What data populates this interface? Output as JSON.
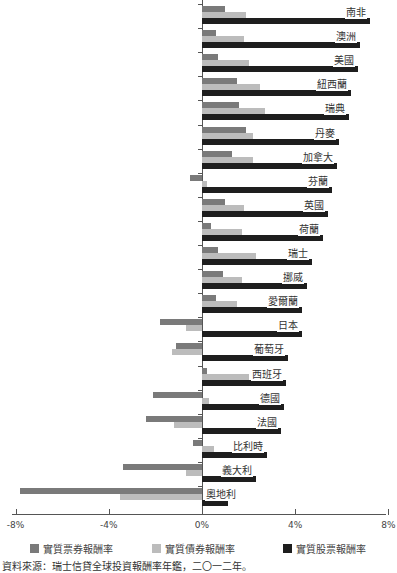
{
  "chart_data": {
    "type": "bar",
    "orientation": "horizontal",
    "title": "",
    "xlabel": "",
    "ylabel": "",
    "xlim": [
      -8,
      8
    ],
    "x_ticks": [
      "-8%",
      "-4%",
      "0%",
      "4%",
      "8%"
    ],
    "grid": false,
    "legend_position": "bottom",
    "categories": [
      "南非",
      "澳洲",
      "美國",
      "紐西蘭",
      "瑞典",
      "丹麥",
      "加拿大",
      "芬蘭",
      "英國",
      "荷蘭",
      "瑞士",
      "挪威",
      "愛爾蘭",
      "日本",
      "葡萄牙",
      "西班牙",
      "德國",
      "法國",
      "比利時",
      "義大利",
      "奧地利"
    ],
    "series": [
      {
        "name": "實質票券報酬率",
        "color": "#7a7a7a",
        "values": [
          1.0,
          0.6,
          0.7,
          1.5,
          1.6,
          1.9,
          1.3,
          -0.5,
          1.0,
          0.4,
          0.7,
          0.9,
          0.6,
          -1.8,
          -1.1,
          0.2,
          -2.1,
          -2.4,
          -0.4,
          -3.4,
          -7.8
        ]
      },
      {
        "name": "實質債券報酬率",
        "color": "#bcbcbc",
        "values": [
          1.9,
          1.8,
          2.0,
          2.5,
          2.7,
          2.2,
          2.2,
          0.2,
          1.8,
          1.7,
          2.3,
          1.7,
          1.5,
          -0.7,
          -1.3,
          2.0,
          0.3,
          -1.2,
          0.5,
          -0.7,
          -3.5
        ]
      },
      {
        "name": "實質股票報酬率",
        "color": "#1e1e1e",
        "values": [
          7.2,
          6.8,
          6.7,
          6.4,
          6.3,
          5.9,
          5.8,
          5.6,
          5.4,
          5.2,
          4.7,
          4.5,
          4.3,
          4.3,
          3.7,
          3.6,
          3.5,
          3.4,
          2.8,
          2.3,
          1.1
        ]
      }
    ]
  },
  "legend": {
    "items": [
      {
        "label": "實質票券報酬率",
        "color": "#7a7a7a"
      },
      {
        "label": "實質債券報酬率",
        "color": "#bcbcbc"
      },
      {
        "label": "實質股票報酬率",
        "color": "#1e1e1e"
      }
    ]
  },
  "source": "資料來源：瑞士信貸全球投資報酬率年鑑，二〇一二年。"
}
